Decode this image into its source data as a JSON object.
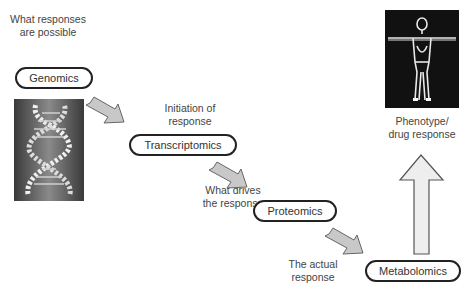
{
  "diagram": {
    "stages": [
      {
        "name": "Genomics",
        "caption": [
          "What responses",
          "are possible"
        ]
      },
      {
        "name": "Transcriptomics",
        "caption": [
          "Initiation of",
          "response"
        ]
      },
      {
        "name": "Proteomics",
        "caption": [
          "What drives",
          "the response"
        ]
      },
      {
        "name": "Metabolomics",
        "caption": [
          "The actual",
          "response"
        ]
      }
    ],
    "outcome": {
      "caption": [
        "Phenotype/",
        "drug response"
      ]
    },
    "images": {
      "dna": "dna-double-helix-image",
      "body": "human-body-figure-image"
    },
    "colors": {
      "arrow_fill": "#c8c8c8",
      "arrow_stroke": "#666666",
      "big_arrow_fill": "#eeeeee",
      "pill_border": "#222222"
    }
  }
}
